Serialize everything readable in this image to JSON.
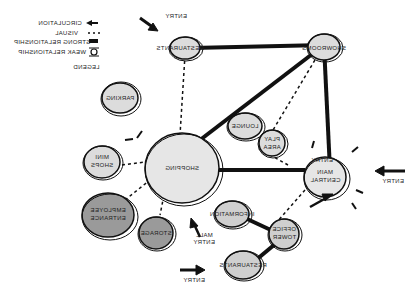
{
  "legend": {
    "title": "LEGEND",
    "items": [
      {
        "symbol": "arrow",
        "label": "CIRCULATION"
      },
      {
        "symbol": "dotted-line",
        "label": "VISUAL"
      },
      {
        "symbol": "thick-line",
        "label": "STRONG RELATIONSHIP"
      },
      {
        "symbol": "tie",
        "label": "WEAK RELATIONSHIP"
      }
    ]
  },
  "nodes": {
    "restaurants_top": "RESTAURANTS",
    "showrooms": "SHOWROOMS",
    "parking": "PARKING",
    "shopping": "SHOPPING",
    "mini_shops": [
      "MINI",
      "SHOPS"
    ],
    "lounge": "LOUNGE",
    "play_area": [
      "PLAY",
      "AREA"
    ],
    "central_hall": [
      "MAIN",
      "CENTRAL"
    ],
    "employee_entrance": [
      "EMPLOYEE",
      "ENTRANCE"
    ],
    "storage": "STORAGE",
    "information": "INFORMATION",
    "office_tower": [
      "OFFICE",
      "TOWER"
    ],
    "restaurants_bottom": "RESTAURANTS"
  },
  "entries": {
    "top": "ENTRY",
    "right": "ENTRY",
    "hall": "ENTRY",
    "mall": [
      "MALL",
      "ENTRY"
    ],
    "bottom": "ENTRY"
  },
  "colors": {
    "light_fill": "#dcdcdc",
    "dark_fill": "#9a9a9a",
    "stroke": "#111111"
  }
}
